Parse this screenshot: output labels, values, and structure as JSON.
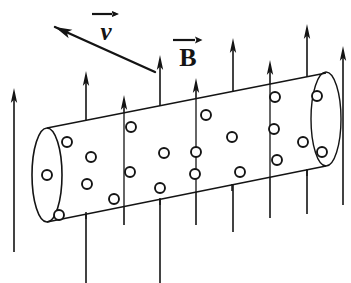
{
  "figure": {
    "type": "physics-vector-diagram",
    "background_color": "#ffffff",
    "ink_color": "#141414"
  },
  "labels": {
    "velocity": {
      "symbol": "v",
      "name": "velocity-vector-label",
      "style": "italic",
      "overbar": "right-arrow"
    },
    "magnetic_field": {
      "symbol": "B",
      "name": "magnetic-field-vector-label",
      "style": "upright",
      "overbar": "right-arrow"
    }
  },
  "velocity_arrow": {
    "name": "velocity-arrow",
    "direction": "up-left",
    "tail": [
      155,
      72
    ],
    "tip": [
      55,
      27
    ]
  },
  "field_arrows": {
    "name": "magnetic-field-arrows",
    "direction": "up",
    "count": 9,
    "arrows": [
      {
        "x": 14,
        "tip_y": 88,
        "tail_y": 252
      },
      {
        "x": 86,
        "tip_y": 71,
        "tail_y": 283
      },
      {
        "x": 124,
        "tip_y": 95,
        "tail_y": 225
      },
      {
        "x": 160,
        "tip_y": 55,
        "tail_y": 283
      },
      {
        "x": 196,
        "tip_y": 78,
        "tail_y": 225
      },
      {
        "x": 233,
        "tip_y": 38,
        "tail_y": 232
      },
      {
        "x": 270,
        "tip_y": 60,
        "tail_y": 218
      },
      {
        "x": 307,
        "tip_y": 24,
        "tail_y": 214
      },
      {
        "x": 343,
        "tip_y": 46,
        "tail_y": 205
      }
    ]
  },
  "cylinder": {
    "name": "conducting-cylinder",
    "top_edge": {
      "from": [
        47,
        128
      ],
      "to": [
        326,
        73
      ]
    },
    "bottom_edge": {
      "from": [
        47,
        222
      ],
      "to": [
        326,
        166
      ]
    },
    "left_cap": {
      "cx": 47,
      "cy": 175,
      "rx": 15,
      "ry": 47
    },
    "right_cap": {
      "cx": 326,
      "cy": 119,
      "rx": 15,
      "ry": 47
    },
    "cross_lines": [
      {
        "x_top": 124,
        "y_top": 113,
        "x_bot": 124,
        "y_bot": 207
      },
      {
        "x_top": 196,
        "y_top": 99,
        "x_bot": 196,
        "y_bot": 193
      },
      {
        "x_top": 270,
        "y_top": 84,
        "x_bot": 270,
        "y_bot": 178
      }
    ],
    "tick_marks": [
      {
        "x": 86,
        "y": 212
      },
      {
        "x": 160,
        "y": 198
      },
      {
        "x": 232,
        "y": 184
      },
      {
        "x": 307,
        "y": 169
      }
    ]
  },
  "charge_dots": {
    "name": "charge-circles",
    "meaning": "free charges / field out of page",
    "radius": 5,
    "points": [
      [
        47,
        175
      ],
      [
        67,
        142
      ],
      [
        59,
        215
      ],
      [
        91,
        157
      ],
      [
        87,
        184
      ],
      [
        114,
        199
      ],
      [
        131,
        127
      ],
      [
        130,
        172
      ],
      [
        164,
        153
      ],
      [
        160,
        188
      ],
      [
        206,
        115
      ],
      [
        196,
        152
      ],
      [
        195,
        174
      ],
      [
        232,
        137
      ],
      [
        240,
        172
      ],
      [
        275,
        97
      ],
      [
        274,
        129
      ],
      [
        277,
        160
      ],
      [
        303,
        142
      ],
      [
        317,
        96
      ],
      [
        322,
        152
      ]
    ]
  }
}
